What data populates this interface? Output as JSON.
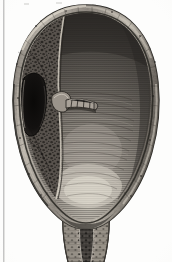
{
  "plate": {
    "title": "Bladder in coronal section",
    "medium": "engraving",
    "palette": {
      "page": "#fdfdfc",
      "gutter_line": "#b9b9b9",
      "wall_outer": "#6e6a64",
      "wall_mid": "#8d8880",
      "wall_highlight": "#d9d4ca",
      "wall_shadow": "#3a3834",
      "lumen_dark": "#4a4642",
      "lumen_mid": "#6b6660",
      "lumen_highlight": "#cfcabf",
      "trabecular": "#5a5550",
      "cavity_black": "#151312",
      "tube": "#9c968c"
    }
  },
  "figure": {
    "name": "urinary-bladder-coronal-section",
    "parts": [
      {
        "id": "outer-wall",
        "label": "Bladder wall (detrusor muscle)"
      },
      {
        "id": "lumen",
        "label": "Bladder lumen / cavity"
      },
      {
        "id": "trabecular-zone",
        "label": "Trabeculated mucosa (left wall)"
      },
      {
        "id": "diverticulum",
        "label": "Dark diverticulum / cavity"
      },
      {
        "id": "ureteric-tube",
        "label": "Ureteric orifice with tube"
      },
      {
        "id": "bladder-neck",
        "label": "Bladder neck"
      },
      {
        "id": "urethra",
        "label": "Urethral canal"
      },
      {
        "id": "fundus-highlight",
        "label": "Illuminated fundus of lumen"
      }
    ]
  },
  "page": {
    "top_marks": [
      "mark",
      "mark",
      "mark"
    ],
    "caption": ""
  }
}
